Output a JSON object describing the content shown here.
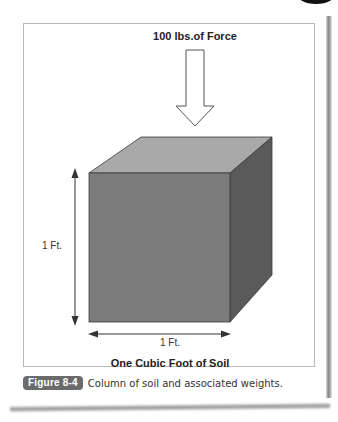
{
  "diagram": {
    "force_label": "100 lbs.of Force",
    "height_label": "1 Ft.",
    "width_label": "1 Ft.",
    "title": "One Cubic Foot of Soil",
    "colors": {
      "front_face": "#7b7b7b",
      "top_face": "#a9a9a9",
      "right_face": "#5a5a5a",
      "edge": "#3a3a3a"
    }
  },
  "caption": {
    "figure_label": "Figure 8-4",
    "text": "Column of soil and associated weights."
  }
}
